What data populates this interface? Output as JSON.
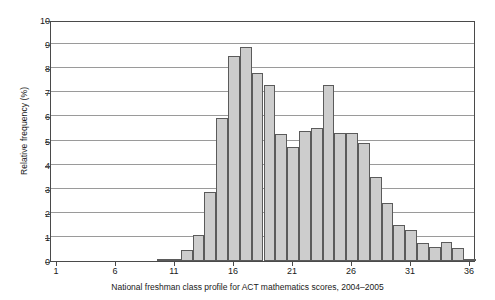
{
  "chart_data": {
    "type": "bar",
    "title": "",
    "caption": "National freshman class profile for ACT mathematics scores, 2004–2005",
    "xlabel": "",
    "ylabel": "Relative frequency (%)",
    "xlim": [
      0.5,
      36.5
    ],
    "ylim": [
      0,
      10
    ],
    "grid": true,
    "legend": null,
    "bar_fill_color": "#cdcdcd",
    "bar_edge_color": "#5b5b5b",
    "grid_color": "#9a9a9a",
    "axis_color": "#4a4a4a",
    "xticks": [
      1,
      6,
      11,
      16,
      21,
      26,
      31,
      36
    ],
    "xtick_labels": [
      "1",
      "6",
      "11",
      "16",
      "21",
      "26",
      "31",
      "36"
    ],
    "yticks": [
      0,
      1,
      2,
      3,
      4,
      5,
      6,
      7,
      8,
      9,
      10
    ],
    "ytick_labels": [
      "0",
      "1",
      "2",
      "3",
      "4",
      "5",
      "6",
      "7",
      "8",
      "9",
      "10"
    ],
    "categories": [
      1,
      2,
      3,
      4,
      5,
      6,
      7,
      8,
      9,
      10,
      11,
      12,
      13,
      14,
      15,
      16,
      17,
      18,
      19,
      20,
      21,
      22,
      23,
      24,
      25,
      26,
      27,
      28,
      29,
      30,
      31,
      32,
      33,
      34,
      35,
      36
    ],
    "values": [
      0,
      0,
      0,
      0,
      0,
      0,
      0,
      0,
      0,
      0.07,
      0.07,
      0.45,
      1.1,
      2.85,
      5.95,
      8.5,
      8.9,
      7.8,
      7.3,
      5.25,
      4.75,
      5.4,
      5.5,
      7.3,
      5.3,
      5.3,
      4.9,
      3.5,
      2.4,
      1.5,
      1.3,
      0.75,
      0.6,
      0.8,
      0.55,
      0.1
    ]
  }
}
